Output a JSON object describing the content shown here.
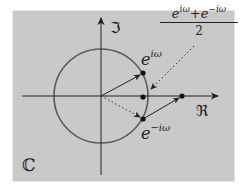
{
  "diagram": {
    "plane_label": "ℂ",
    "axes": {
      "real_label": "ℜ",
      "imag_label": "ℑ"
    },
    "labels": {
      "e_pos_base": "e",
      "e_pos_exp": "iω",
      "e_neg_base": "e",
      "e_neg_exp": "−iω",
      "fraction_num_a_base": "e",
      "fraction_num_a_exp": "iω",
      "fraction_plus": "+",
      "fraction_num_b_base": "e",
      "fraction_num_b_exp": "−iω",
      "fraction_den": "2"
    },
    "colors": {
      "background_outer": "#ffffff",
      "panel": "#c9c9c9",
      "circle": "#5a5a5a",
      "axis": "#222222",
      "vector": "#222222"
    },
    "geometry": {
      "origin": [
        101,
        96
      ],
      "radius": 47,
      "points": {
        "e_pos": [
          143,
          73
        ],
        "e_neg": [
          143,
          119
        ],
        "midpoint": [
          143,
          97
        ],
        "sum": [
          182,
          96
        ]
      }
    }
  }
}
